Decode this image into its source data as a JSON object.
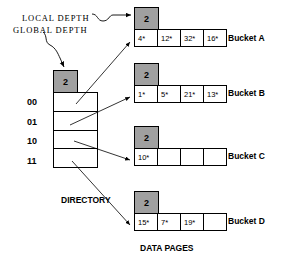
{
  "diagram": {
    "title_bottom": "DATA PAGES",
    "directory_label": "DIRECTORY",
    "annotations": {
      "local_depth": "LOCAL  DEPTH",
      "global_depth": "GLOBAL  DEPTH"
    },
    "colors": {
      "depth_box_fill": "#a0a0a0",
      "cell_fill": "#ffffff",
      "stroke": "#000000",
      "background": "#ffffff"
    },
    "directory": {
      "global_depth": "2",
      "entries": [
        {
          "index": "00"
        },
        {
          "index": "01"
        },
        {
          "index": "10"
        },
        {
          "index": "11"
        }
      ]
    },
    "buckets": [
      {
        "name": "Bucket A",
        "local_depth": "2",
        "entries": [
          "4*",
          "12*",
          "32*",
          "16*"
        ]
      },
      {
        "name": "Bucket B",
        "local_depth": "2",
        "entries": [
          "1*",
          "5*",
          "21*",
          "13*"
        ]
      },
      {
        "name": "Bucket C",
        "local_depth": "2",
        "entries": [
          "10*",
          "",
          "",
          ""
        ]
      },
      {
        "name": "Bucket D",
        "local_depth": "2",
        "entries": [
          "15*",
          "7*",
          "19*",
          ""
        ]
      }
    ]
  }
}
